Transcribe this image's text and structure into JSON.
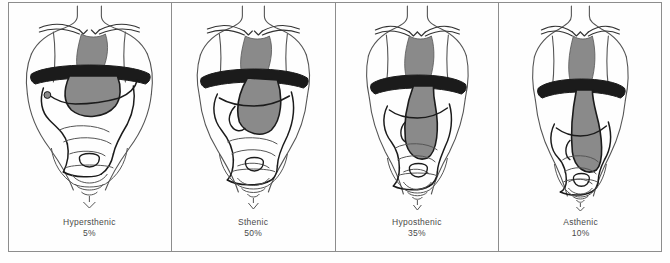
{
  "figure": {
    "colors": {
      "outline": "#1b1b1b",
      "body_outline": "#555555",
      "organ_fill": "#8a8a8a",
      "frame": "#8d8d8d",
      "caption_text": "#4a4a4a",
      "background": "#ffffff"
    }
  },
  "panels": [
    {
      "id": "hypersthenic",
      "label": "Hypersthenic",
      "percent": "5%",
      "torso_width": "broad",
      "stomach_position": "high and transverse",
      "organ_name": "stomach-shadow"
    },
    {
      "id": "sthenic",
      "label": "Sthenic",
      "percent": "50%",
      "torso_width": "average",
      "stomach_position": "j-shaped mid abdomen",
      "organ_name": "stomach-shadow"
    },
    {
      "id": "hyposthenic",
      "label": "Hyposthenic",
      "percent": "35%",
      "torso_width": "slender",
      "stomach_position": "low and vertical",
      "organ_name": "stomach-shadow"
    },
    {
      "id": "asthenic",
      "label": "Asthenic",
      "percent": "10%",
      "torso_width": "very narrow",
      "stomach_position": "very low, reaching pelvis",
      "organ_name": "stomach-shadow"
    }
  ]
}
